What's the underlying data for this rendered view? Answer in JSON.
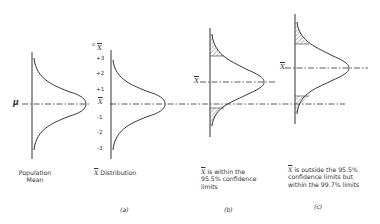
{
  "diagram": {
    "population": {
      "symbol": "μ",
      "caption_line1": "Population",
      "caption_line2": "Mean"
    },
    "xbar_distribution": {
      "axis_title_sigma": "σ",
      "axis_title_symbol": "X",
      "ticks": [
        "+3",
        "+2",
        "+1",
        "X",
        "-1",
        "-2",
        "-3"
      ],
      "caption_symbol": "X",
      "caption_text": " Distribution",
      "panel_label": "(a)"
    },
    "within": {
      "symbol": "X",
      "caption_text": "is within the 95.5% confidence limits",
      "panel_label": "(b)"
    },
    "outside": {
      "symbol": "X",
      "caption_text": "is outside the 95.5% confidence limits but within the 99.7% limits",
      "panel_label": "(c)"
    }
  }
}
